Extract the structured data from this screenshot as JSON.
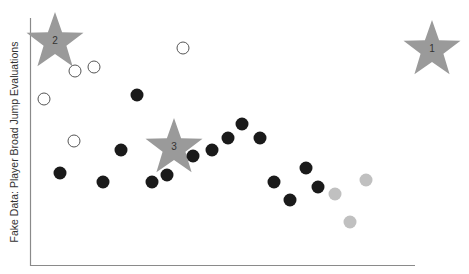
{
  "chart_data": {
    "type": "scatter",
    "title": "",
    "xlabel": "",
    "ylabel": "Fake Data: Player Broad Jump Evaluations",
    "grid": false,
    "legend": null,
    "axes": {
      "x_pixel_range": [
        30,
        415
      ],
      "y_pixel_range": [
        18,
        265
      ]
    },
    "series": [
      {
        "name": "filled-black",
        "style": "filled",
        "color": "#1a1a1a",
        "points": [
          [
            137,
            95
          ],
          [
            121,
            150
          ],
          [
            60,
            173
          ],
          [
            103,
            182
          ],
          [
            152,
            182
          ],
          [
            167,
            175
          ],
          [
            193,
            156
          ],
          [
            212,
            150
          ],
          [
            228,
            138
          ],
          [
            242,
            124
          ],
          [
            260,
            138
          ],
          [
            274,
            182
          ],
          [
            306,
            168
          ],
          [
            318,
            187
          ],
          [
            290,
            200
          ]
        ]
      },
      {
        "name": "open-circle",
        "style": "hollow",
        "color": "#555555",
        "points": [
          [
            183,
            48
          ],
          [
            75,
            71
          ],
          [
            94,
            67
          ],
          [
            44,
            99
          ],
          [
            74,
            141
          ]
        ]
      },
      {
        "name": "light-gray",
        "style": "filled",
        "color": "#c0c0c0",
        "points": [
          [
            335,
            194
          ],
          [
            366,
            180
          ],
          [
            350,
            222
          ]
        ]
      }
    ],
    "annotations": [
      {
        "type": "star",
        "label": "1",
        "x": 432,
        "y": 48,
        "color": "#9a9a9a"
      },
      {
        "type": "star",
        "label": "2",
        "x": 55,
        "y": 40,
        "color": "#9a9a9a"
      },
      {
        "type": "star",
        "label": "3",
        "x": 174,
        "y": 146,
        "color": "#9a9a9a"
      }
    ]
  }
}
